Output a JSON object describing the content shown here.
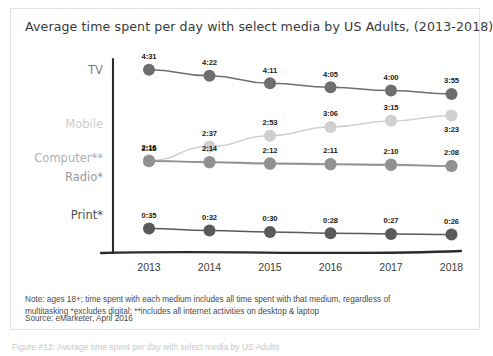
{
  "card": {
    "title": "Average time spent per day with select media by US Adults, (2013-2018)",
    "footnote_line1": "Note: ages 18+; time spent with each medium includes all time spent with that medium, regardless of",
    "footnote_line2": "multitasking *excludes digital; **includes all internet activities on desktop & laptop",
    "source": "Source: eMarketer, April 2016"
  },
  "caption": "Figure #12: Average time spent per day with select media by US Adults",
  "colors": {
    "tv": "#6e6e6e",
    "mobile": "#cfcfcf",
    "computer": "#a8a8a8",
    "radio": "#919191",
    "print": "#5a5a5a",
    "axis": "#2b2b2b",
    "label_text": "#1b1b1b",
    "title_text": "#3a3a3a"
  },
  "chart_data": {
    "type": "line",
    "title": "Average time spent per day with select media by US Adults, (2013-2018)",
    "xlabel": "",
    "ylabel": "",
    "grid": false,
    "legend_position": "left-row-labels",
    "categories": [
      "2013",
      "2014",
      "2015",
      "2016",
      "2017",
      "2018"
    ],
    "value_unit": "hours:minutes per day",
    "series": [
      {
        "name": "TV",
        "color": "#6e6e6e",
        "labels": [
          "4:31",
          "4:22",
          "4:11",
          "4:05",
          "4:00",
          "3:55"
        ],
        "values_minutes": [
          271,
          262,
          251,
          245,
          240,
          235
        ],
        "label_position": "above"
      },
      {
        "name": "Mobile",
        "color": "#cfcfcf",
        "labels": [
          "2:16",
          "2:37",
          "2:53",
          "3:06",
          "3:15",
          "3:23"
        ],
        "values_minutes": [
          136,
          157,
          173,
          186,
          195,
          203
        ],
        "label_position": "above-except-last-below"
      },
      {
        "name": "Computer**",
        "color": "#a8a8a8",
        "labels": [
          "",
          "",
          "",
          "",
          "",
          ""
        ],
        "values_minutes": [
          136,
          133,
          131,
          130,
          129,
          128
        ],
        "label_position": "none"
      },
      {
        "name": "Radio*",
        "color": "#919191",
        "labels": [
          "2:15",
          "2:14",
          "2:12",
          "2:11",
          "2:10",
          "2:08"
        ],
        "values_minutes": [
          135,
          134,
          132,
          131,
          130,
          128
        ],
        "label_position": "above"
      },
      {
        "name": "Print*",
        "color": "#5a5a5a",
        "labels": [
          "0:35",
          "0:32",
          "0:30",
          "0:28",
          "0:27",
          "0:26"
        ],
        "values_minutes": [
          35,
          32,
          30,
          28,
          27,
          26
        ],
        "label_position": "above"
      }
    ]
  },
  "row_labels": [
    {
      "name": "TV",
      "color": "#7d7d7d"
    },
    {
      "name": "Mobile",
      "color": "#cccccc"
    },
    {
      "name": "Computer**",
      "color": "#b0b0b0"
    },
    {
      "name": "Radio*",
      "color": "#9a9a9a"
    },
    {
      "name": "Print*",
      "color": "#4f4f4f"
    }
  ]
}
